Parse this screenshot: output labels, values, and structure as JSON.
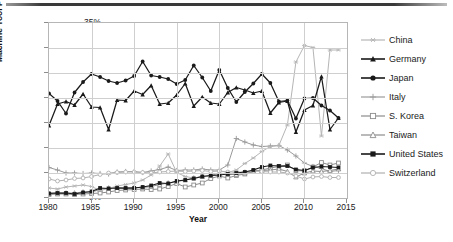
{
  "chart_data": {
    "type": "line",
    "title": "",
    "xlabel": "Year",
    "ylabel": "Machine Tool Production",
    "xlim": [
      1980,
      2015
    ],
    "ylim": [
      0,
      0.35
    ],
    "grid": true,
    "legend_position": "right",
    "y_ticks": [
      "0%",
      "5%",
      "10%",
      "15%",
      "20%",
      "25%",
      "30%",
      "35%"
    ],
    "y_tick_values": [
      0,
      5,
      10,
      15,
      20,
      25,
      30,
      35
    ],
    "x_ticks": [
      "1980",
      "1985",
      "1990",
      "1995",
      "2000",
      "2005",
      "2010",
      "2015"
    ],
    "x_tick_values": [
      1980,
      1985,
      1990,
      1995,
      2000,
      2005,
      2010,
      2015
    ],
    "x": [
      1980,
      1981,
      1982,
      1983,
      1984,
      1985,
      1986,
      1987,
      1988,
      1989,
      1990,
      1991,
      1992,
      1993,
      1994,
      1995,
      1996,
      1997,
      1998,
      1999,
      2000,
      2001,
      2002,
      2003,
      2004,
      2005,
      2006,
      2007,
      2008,
      2009,
      2010,
      2011,
      2012,
      2013,
      2014
    ],
    "series": [
      {
        "name": "China",
        "marker": "asterisk",
        "color": "#b5b5b5",
        "values": [
          2.0,
          1.8,
          2.2,
          2.4,
          2.6,
          2.3,
          1.5,
          1.9,
          2.4,
          2.7,
          3.0,
          3.6,
          4.6,
          6.4,
          8.8,
          5.1,
          4.3,
          4.0,
          4.2,
          4.4,
          4.7,
          5.1,
          5.6,
          6.9,
          8.0,
          9.3,
          10.3,
          10.5,
          14.6,
          27.2,
          30.5,
          30.1,
          12.4,
          29.6,
          29.6
        ]
      },
      {
        "name": "Germany",
        "marker": "triangle",
        "color": "#1a1a1a",
        "values": [
          14.5,
          18.8,
          19.3,
          18.6,
          20.8,
          18.2,
          18.1,
          13.7,
          19.6,
          19.5,
          21.4,
          20.7,
          22.5,
          18.8,
          19.0,
          20.6,
          22.9,
          18.4,
          20.2,
          19.0,
          18.8,
          21.1,
          22.1,
          21.6,
          21.0,
          21.4,
          17.0,
          19.1,
          19.4,
          13.2,
          17.6,
          18.5,
          24.3,
          13.7,
          16.0
        ]
      },
      {
        "name": "Japan",
        "marker": "circle",
        "color": "#1a1a1a",
        "values": [
          20.9,
          19.4,
          16.9,
          21.1,
          23.2,
          24.8,
          24.2,
          23.4,
          23.0,
          23.5,
          24.4,
          27.3,
          24.5,
          24.2,
          23.8,
          22.8,
          23.6,
          26.5,
          24.1,
          21.4,
          25.6,
          22.0,
          19.2,
          21.2,
          22.9,
          24.8,
          23.0,
          19.3,
          19.5,
          15.9,
          19.9,
          20.0,
          18.5,
          17.5,
          16.0
        ]
      },
      {
        "name": "Italy",
        "marker": "plus",
        "color": "#9a9a9a",
        "values": [
          6.1,
          5.6,
          5.0,
          5.0,
          4.9,
          5.0,
          4.9,
          4.8,
          5.2,
          5.3,
          5.3,
          5.1,
          5.4,
          5.7,
          6.2,
          5.5,
          5.6,
          5.6,
          5.8,
          5.6,
          5.6,
          6.6,
          11.9,
          11.2,
          10.6,
          10.3,
          10.4,
          10.5,
          9.6,
          8.4,
          7.0,
          6.3,
          5.9,
          5.3,
          5.5
        ]
      },
      {
        "name": "S. Korea",
        "marker": "square-open",
        "color": "#8c8c8c",
        "values": [
          0.7,
          0.8,
          0.8,
          0.7,
          0.8,
          0.9,
          1.0,
          1.2,
          1.5,
          1.6,
          1.7,
          1.8,
          1.7,
          1.8,
          2.3,
          2.9,
          2.2,
          2.6,
          3.0,
          3.9,
          4.4,
          4.0,
          4.5,
          4.8,
          5.3,
          5.6,
          6.0,
          6.3,
          6.6,
          5.5,
          5.4,
          6.2,
          7.1,
          6.6,
          7.0
        ]
      },
      {
        "name": "Taiwan",
        "marker": "triangle-open",
        "color": "#8c8c8c",
        "values": [
          0.9,
          1.0,
          1.0,
          1.0,
          1.2,
          1.2,
          1.7,
          2.0,
          2.1,
          2.0,
          2.1,
          2.1,
          2.3,
          2.7,
          3.0,
          3.3,
          3.6,
          4.0,
          4.3,
          4.5,
          5.0,
          4.7,
          4.7,
          5.0,
          5.5,
          5.5,
          5.6,
          5.8,
          5.3,
          4.2,
          5.0,
          5.4,
          5.3,
          5.5,
          5.8
        ]
      },
      {
        "name": "United States",
        "marker": "square",
        "color": "#1a1a1a",
        "values": [
          0.9,
          1.0,
          1.0,
          0.8,
          1.1,
          1.3,
          2.0,
          1.9,
          2.0,
          2.0,
          2.0,
          2.2,
          2.5,
          3.0,
          2.9,
          3.4,
          3.6,
          3.9,
          4.3,
          4.5,
          4.6,
          4.8,
          5.0,
          5.2,
          5.6,
          6.2,
          6.5,
          6.4,
          6.4,
          5.7,
          5.5,
          6.1,
          6.3,
          6.2,
          6.1
        ]
      },
      {
        "name": "Switzerland",
        "marker": "circle-open",
        "color": "#b0b0b0",
        "values": [
          3.8,
          3.4,
          3.6,
          3.9,
          4.0,
          4.3,
          4.7,
          5.0,
          5.1,
          5.2,
          5.2,
          5.1,
          5.0,
          5.2,
          5.3,
          5.4,
          5.3,
          5.4,
          5.5,
          5.3,
          5.4,
          5.2,
          5.2,
          5.2,
          5.4,
          5.3,
          5.2,
          5.2,
          5.0,
          4.4,
          3.8,
          4.2,
          4.3,
          4.1,
          4.1
        ]
      }
    ]
  },
  "legend": {
    "items": [
      {
        "label": "China"
      },
      {
        "label": "Germany"
      },
      {
        "label": "Japan"
      },
      {
        "label": "Italy"
      },
      {
        "label": "S. Korea"
      },
      {
        "label": "Taiwan"
      },
      {
        "label": "United States"
      },
      {
        "label": "Switzerland"
      }
    ]
  }
}
